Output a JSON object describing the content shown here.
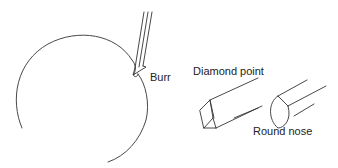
{
  "diagram": {
    "labels": {
      "burr": "Burr",
      "diamond_point": "Diamond point",
      "round_nose": "Round nose"
    },
    "stroke_color": "#333333"
  }
}
